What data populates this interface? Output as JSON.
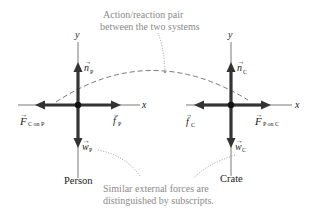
{
  "annotations": {
    "top_line1": "Action/reaction pair",
    "top_line2": "between the two systems",
    "bottom_line1": "Similar external forces are",
    "bottom_line2": "distinguished by subscripts."
  },
  "person": {
    "name": "Person",
    "axis_x": "x",
    "axis_y": "y",
    "forces": {
      "normal": {
        "symbol": "n",
        "sub": "P"
      },
      "friction": {
        "symbol": "f",
        "sub": "P"
      },
      "weight": {
        "symbol": "w",
        "sub": "P"
      },
      "contact": {
        "symbol": "F",
        "sub": "C on P"
      }
    }
  },
  "crate": {
    "name": "Crate",
    "axis_x": "x",
    "axis_y": "y",
    "forces": {
      "normal": {
        "symbol": "n",
        "sub": "C"
      },
      "friction": {
        "symbol": "f",
        "sub": "C"
      },
      "weight": {
        "symbol": "w",
        "sub": "C"
      },
      "contact": {
        "symbol": "F",
        "sub": "P on C"
      }
    }
  },
  "arrow_glyph": "→",
  "colors": {
    "vector": "#333333",
    "annotation": "#8a8a8a",
    "axis": "#555555"
  }
}
